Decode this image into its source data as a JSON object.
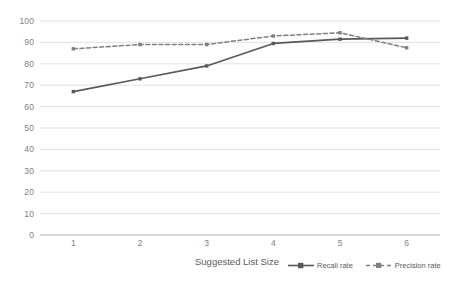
{
  "chart_data": {
    "type": "line",
    "title": "",
    "subtitle": "",
    "xlabel": "Suggested List Size",
    "ylabel": "",
    "categories": [
      "1",
      "2",
      "3",
      "4",
      "5",
      "6"
    ],
    "x": [
      1,
      2,
      3,
      4,
      5,
      6
    ],
    "series": [
      {
        "name": "Recall rate",
        "values": [
          67,
          73,
          79,
          89.5,
          91.5,
          92
        ],
        "style": "solid",
        "color": "#595959",
        "marker": "square"
      },
      {
        "name": "Precision rate",
        "values": [
          87,
          89,
          89,
          93,
          94.5,
          87.5
        ],
        "style": "dashed",
        "color": "#7f7f7f",
        "marker": "square"
      }
    ],
    "ylim": [
      0,
      100
    ],
    "ytick_labels": [
      "0",
      "10",
      "20",
      "30",
      "40",
      "50",
      "60",
      "70",
      "80",
      "90",
      "100"
    ],
    "ytick_values": [
      0,
      10,
      20,
      30,
      40,
      50,
      60,
      70,
      80,
      90,
      100
    ],
    "xtick_labels": [
      "1",
      "2",
      "3",
      "4",
      "5",
      "6"
    ],
    "grid": {
      "horizontal": true,
      "vertical": false,
      "color": "#d9d9d9"
    },
    "legend": {
      "position": "bottom-right",
      "entries": [
        "Recall rate",
        "Precision rate"
      ]
    },
    "background": "#ffffff",
    "plot_background": "#ffffff"
  }
}
